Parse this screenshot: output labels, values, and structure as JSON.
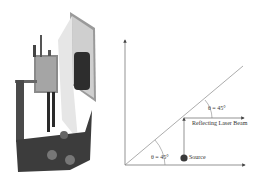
{
  "diagram": {
    "upper_angle_label": "θ = 45°",
    "lower_angle_label": "θ = 45°",
    "beam_label": "Reflecting Laser Beam",
    "source_label": "Source"
  },
  "colors": {
    "line": "#555555",
    "source_dot": "#3a3a3a",
    "mirror": "#d8d8d8"
  }
}
